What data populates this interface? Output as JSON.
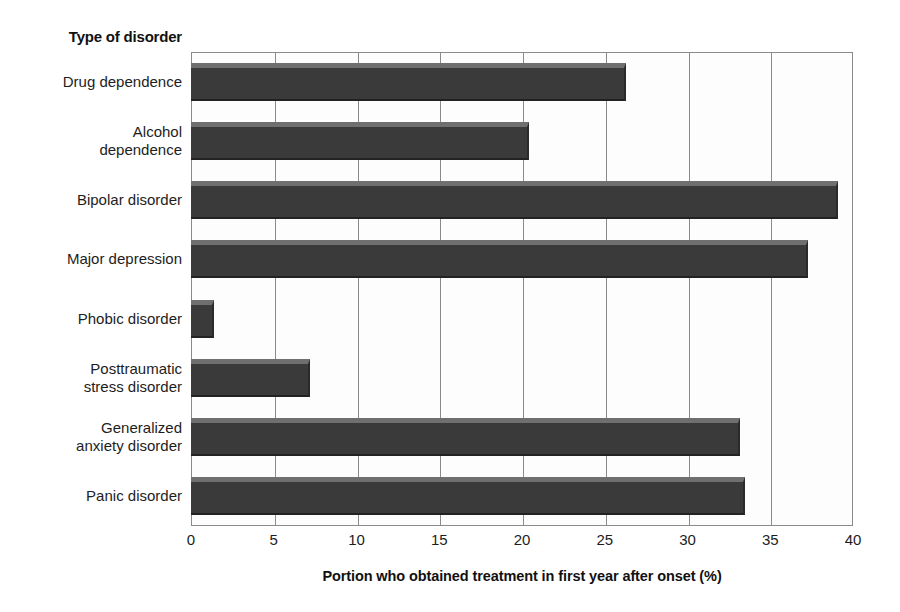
{
  "chart_data": {
    "type": "bar",
    "orientation": "horizontal",
    "title": "",
    "ylabel": "Type of disorder",
    "xlabel": "Portion who obtained treatment in first year after onset (%)",
    "xlim": [
      0,
      40
    ],
    "xticks": [
      0,
      5,
      10,
      15,
      20,
      25,
      30,
      35,
      40
    ],
    "xtick_labels": [
      "0",
      "5",
      "10",
      "15",
      "20",
      "25",
      "30",
      "35",
      "40"
    ],
    "grid": true,
    "legend": "none",
    "bar_color": "#3a3a3a",
    "bar_highlight_color": "#6f6f6f",
    "grid_color": "#8a8a8a",
    "categories": [
      "Drug dependence",
      "Alcohol dependence",
      "Bipolar disorder",
      "Major depression",
      "Phobic disorder",
      "Posttraumatic stress disorder",
      "Generalized anxiety disorder",
      "Panic disorder"
    ],
    "category_label_lines": [
      [
        "Drug dependence"
      ],
      [
        "Alcohol",
        "dependence"
      ],
      [
        "Bipolar disorder"
      ],
      [
        "Major depression"
      ],
      [
        "Phobic disorder"
      ],
      [
        "Posttraumatic",
        "stress disorder"
      ],
      [
        "Generalized",
        "anxiety disorder"
      ],
      [
        "Panic disorder"
      ]
    ],
    "values": [
      26.3,
      20.4,
      39.1,
      37.3,
      1.4,
      7.2,
      33.2,
      33.5
    ]
  }
}
